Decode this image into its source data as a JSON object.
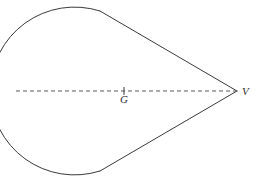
{
  "figure": {
    "background_color": "#ffffff",
    "stroke_color": "#3a3a3a",
    "dash_color": "#5a5a5a",
    "label_color": "#2e2e2e",
    "stroke_width": 1,
    "canvas": {
      "width": 260,
      "height": 183
    },
    "geometry": {
      "arc": {
        "center_x": 100,
        "center_y": 91,
        "radius": 84,
        "leftmost_x": 16,
        "top_junction_x": 100,
        "top_junction_y": 11,
        "bottom_junction_x": 100,
        "bottom_junction_y": 171
      },
      "vertex": {
        "x": 237,
        "y": 91
      },
      "axis": {
        "x_start": 16,
        "x_end": 237,
        "y": 91
      },
      "centroid_tick": {
        "x": 124,
        "y": 91,
        "half_height": 4
      }
    },
    "labels": {
      "vertex": "V",
      "centroid": "G"
    },
    "label_positions": {
      "vertex": {
        "x": 242,
        "y": 95
      },
      "centroid": {
        "x": 124,
        "y": 103
      }
    }
  }
}
